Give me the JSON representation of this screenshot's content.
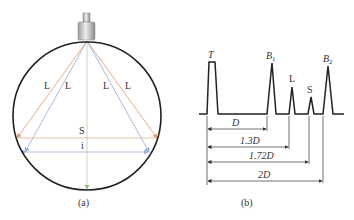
{
  "panel_a": {
    "caption": "(a)",
    "ray_labels": [
      "L",
      "L",
      "L",
      "L"
    ],
    "s_label": "S",
    "i_label": "i",
    "colors": {
      "circle": "#222222",
      "longitudinal_ray": "#e8a07a",
      "shear_ray": "#9fb3d6",
      "center_ray": "#b9cfa0",
      "probe_body": "#c8c8c8"
    }
  },
  "panel_b": {
    "caption": "(b)",
    "peaks": [
      {
        "label": "T",
        "sub": ""
      },
      {
        "label": "B",
        "sub": "1"
      },
      {
        "label": "L",
        "sub": ""
      },
      {
        "label": "S",
        "sub": ""
      },
      {
        "label": "B",
        "sub": "2"
      }
    ],
    "dimensions": [
      {
        "label": "D",
        "multiple": 1.0
      },
      {
        "label": "1.3D",
        "multiple": 1.3
      },
      {
        "label": "1.72D",
        "multiple": 1.72
      },
      {
        "label": "2D",
        "multiple": 2.0
      }
    ]
  }
}
